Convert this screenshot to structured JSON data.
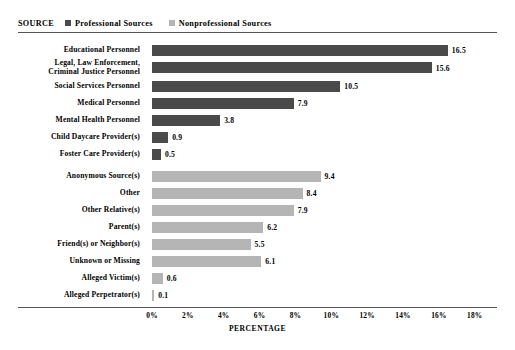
{
  "legend": {
    "title": "SOURCE",
    "entries": [
      {
        "label": "Professional Sources",
        "color": "#4a4a4a"
      },
      {
        "label": "Nonprofessional Sources",
        "color": "#b5b5b5"
      }
    ]
  },
  "chart_data": {
    "type": "bar",
    "orientation": "horizontal",
    "title": "",
    "xlabel": "PERCENTAGE",
    "ylabel": "",
    "xlim": [
      0,
      18
    ],
    "grid": false,
    "legend_position": "top-left",
    "xticks": [
      "0%",
      "2%",
      "4%",
      "6%",
      "8%",
      "10%",
      "12%",
      "14%",
      "16%",
      "18%"
    ],
    "xtick_values": [
      0,
      2,
      4,
      6,
      8,
      10,
      12,
      14,
      16,
      18
    ],
    "categories": [
      "Educational Personnel",
      "Legal, Law Enforcement, Criminal Justice Personnel",
      "Social Services Personnel",
      "Medical Personnel",
      "Mental Health Personnel",
      "Child Daycare Provider(s)",
      "Foster Care Provider(s)",
      "Anonymous Source(s)",
      "Other",
      "Other Relative(s)",
      "Parent(s)",
      "Friend(s) or Neighbor(s)",
      "Unknown or Missing",
      "Alleged Victim(s)",
      "Alleged Perpetrator(s)"
    ],
    "values": [
      16.5,
      15.6,
      10.5,
      7.9,
      3.8,
      0.9,
      0.5,
      9.4,
      8.4,
      7.9,
      6.2,
      5.5,
      6.1,
      0.6,
      0.1
    ],
    "value_labels": [
      "16.5",
      "15.6",
      "10.5",
      "7.9",
      "3.8",
      "0.9",
      "0.5",
      "9.4",
      "8.4",
      "7.9",
      "6.2",
      "5.5",
      "6.1",
      "0.6",
      "0.1"
    ],
    "groups": [
      "Professional Sources",
      "Professional Sources",
      "Professional Sources",
      "Professional Sources",
      "Professional Sources",
      "Professional Sources",
      "Professional Sources",
      "Nonprofessional Sources",
      "Nonprofessional Sources",
      "Nonprofessional Sources",
      "Nonprofessional Sources",
      "Nonprofessional Sources",
      "Nonprofessional Sources",
      "Nonprofessional Sources",
      "Nonprofessional Sources"
    ],
    "label_lines": [
      [
        "Educational Personnel"
      ],
      [
        "Legal, Law Enforcement,",
        "Criminal Justice Personnel"
      ],
      [
        "Social Services Personnel"
      ],
      [
        "Medical Personnel"
      ],
      [
        "Mental Health Personnel"
      ],
      [
        "Child Daycare Provider(s)"
      ],
      [
        "Foster Care Provider(s)"
      ],
      [
        "Anonymous Source(s)"
      ],
      [
        "Other"
      ],
      [
        "Other Relative(s)"
      ],
      [
        "Parent(s)"
      ],
      [
        "Friend(s) or Neighbor(s)"
      ],
      [
        "Unknown or Missing"
      ],
      [
        "Alleged Victim(s)"
      ],
      [
        "Alleged Perpetrator(s)"
      ]
    ]
  }
}
